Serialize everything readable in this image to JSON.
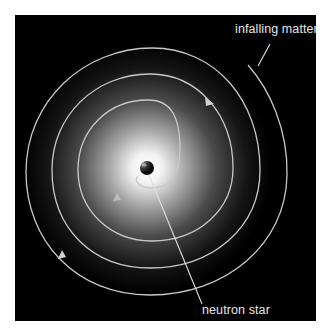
{
  "diagram": {
    "background_color": "#000000",
    "page_color": "#ffffff",
    "spiral_color": "#c8c8c8",
    "labels": {
      "infalling_matter": "infalling matter",
      "neutron_star": "neutron star"
    },
    "elements": [
      {
        "type": "glow",
        "description": "radial white glow around central object"
      },
      {
        "type": "spiral",
        "description": "clockwise inward spiral of infalling matter with direction arrows",
        "loops": 4
      },
      {
        "type": "sphere",
        "name": "neutron star"
      }
    ]
  }
}
